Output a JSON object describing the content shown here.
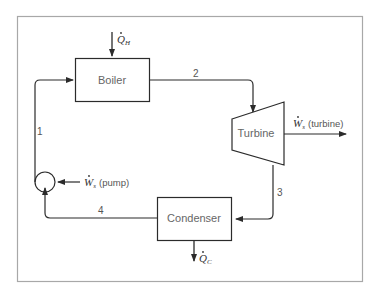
{
  "diagram": {
    "components": {
      "boiler": {
        "label": "Boiler"
      },
      "turbine": {
        "label": "Turbine"
      },
      "condenser": {
        "label": "Condenser"
      },
      "pump": {
        "label": ""
      }
    },
    "streams": [
      {
        "id": "1",
        "label": "1",
        "from": "pump",
        "to": "boiler"
      },
      {
        "id": "2",
        "label": "2",
        "from": "boiler",
        "to": "turbine"
      },
      {
        "id": "3",
        "label": "3",
        "from": "turbine",
        "to": "condenser"
      },
      {
        "id": "4",
        "label": "4",
        "from": "condenser",
        "to": "pump"
      }
    ],
    "energy": {
      "heat_in": {
        "symbol": "Q",
        "subscript": "H"
      },
      "heat_out": {
        "symbol": "Q",
        "subscript": "C"
      },
      "work_turbine": {
        "symbol": "W",
        "subscript": "s",
        "note": "(turbine)"
      },
      "work_pump": {
        "symbol": "W",
        "subscript": "s",
        "note": "(pump)"
      }
    },
    "colors": {
      "line": "#2b2b2b",
      "frame": "#a8a8a8",
      "text": "#555555"
    }
  }
}
